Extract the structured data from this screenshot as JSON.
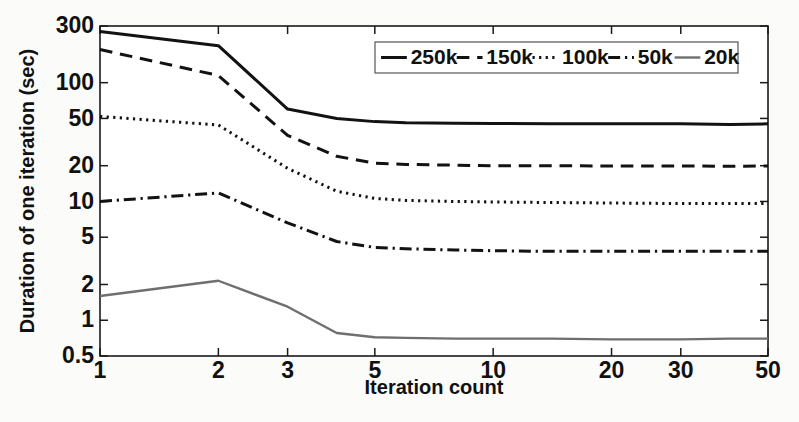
{
  "chart_data": {
    "type": "line",
    "title": "",
    "xlabel": "Iteration count",
    "ylabel": "Duration of one iteration (sec)",
    "xscale": "log",
    "yscale": "log",
    "xlim": [
      1,
      50
    ],
    "ylim": [
      0.5,
      300
    ],
    "grid": false,
    "legend_position": "top-right",
    "xticks": [
      1,
      2,
      3,
      5,
      10,
      20,
      30,
      50
    ],
    "xticklabels": [
      "1",
      "2",
      "3",
      "5",
      "10",
      "20",
      "30",
      "50"
    ],
    "yticks": [
      0.5,
      1,
      2,
      5,
      10,
      20,
      50,
      100,
      300
    ],
    "yticklabels": [
      "0.5",
      "1",
      "2",
      "5",
      "10",
      "20",
      "50",
      "100",
      "300"
    ],
    "x": [
      1,
      2,
      3,
      4,
      5,
      6,
      8,
      10,
      14,
      20,
      30,
      40,
      50
    ],
    "series": [
      {
        "name": "250k",
        "label": "250k",
        "style": "solid",
        "color": "#121212",
        "width": 3.0,
        "values": [
          270,
          205,
          60,
          50,
          47,
          46,
          45.5,
          45.3,
          45.2,
          45.0,
          45.0,
          44.5,
          45.0
        ]
      },
      {
        "name": "150k",
        "label": "150k",
        "style": "dashed",
        "color": "#121212",
        "width": 3.0,
        "values": [
          190,
          115,
          36,
          24,
          21,
          20.5,
          20.2,
          20.0,
          20.0,
          19.9,
          19.9,
          19.8,
          19.9
        ]
      },
      {
        "name": "100k",
        "label": "100k",
        "style": "dotted",
        "color": "#121212",
        "width": 3.0,
        "values": [
          52,
          44,
          19,
          12.2,
          10.6,
          10.2,
          10.0,
          9.9,
          9.8,
          9.7,
          9.6,
          9.6,
          9.6
        ]
      },
      {
        "name": "50k",
        "label": "50k",
        "style": "dashdot",
        "color": "#121212",
        "width": 3.0,
        "values": [
          10.0,
          11.8,
          6.6,
          4.6,
          4.1,
          4.0,
          3.9,
          3.85,
          3.8,
          3.8,
          3.8,
          3.8,
          3.8
        ]
      },
      {
        "name": "20k",
        "label": "20k",
        "style": "solid",
        "color": "#6f6f6f",
        "width": 2.4,
        "values": [
          1.6,
          2.15,
          1.3,
          0.78,
          0.72,
          0.71,
          0.7,
          0.7,
          0.7,
          0.69,
          0.69,
          0.7,
          0.7
        ]
      }
    ]
  },
  "legend": {
    "entries": [
      {
        "label": "250k",
        "style": "solid"
      },
      {
        "label": "150k",
        "style": "dashed"
      },
      {
        "label": "100k",
        "style": "dotted"
      },
      {
        "label": "50k",
        "style": "dashdot"
      },
      {
        "label": "20k",
        "style": "solid-gray"
      }
    ]
  }
}
